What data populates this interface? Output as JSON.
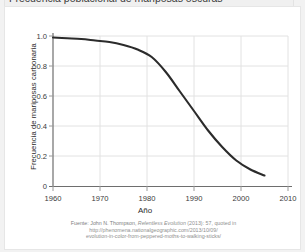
{
  "figure": {
    "title": "Frecuencia poblacional de mariposas oscuras"
  },
  "citation": {
    "line1_prefix": "Fuente: John N. Thompson, ",
    "line1_italic": "Relentless Evolution",
    "line1_suffix": " (2013): 57, quoted in",
    "line2": "http://phenomena.nationalgeographic.com/2013/10/09/",
    "line3": "evolution-in-color-from-peppered-moths-to-walking-sticks/"
  },
  "chart_data": {
    "type": "line",
    "title": "Frecuencia poblacional de mariposas oscuras",
    "xlabel": "Año",
    "ylabel": "Frecuencia de mariposas carbonaria",
    "xlim": [
      1958,
      2012
    ],
    "ylim": [
      0,
      1.0
    ],
    "grid": true,
    "legend": null,
    "line_color": "#2b2b2b",
    "grid_color": "#e0e0e0",
    "xticks": [
      "1960",
      "1970",
      "1980",
      "1990",
      "2000",
      "2010"
    ],
    "xtick_values": [
      1960,
      1970,
      1980,
      1990,
      2000,
      2010
    ],
    "yticks": [
      "0",
      "0.2",
      "0.4",
      "0.6",
      "0.8",
      "1.0"
    ],
    "ytick_values": [
      0,
      0.2,
      0.4,
      0.6,
      0.8,
      1.0
    ],
    "series": [
      {
        "name": "Frecuencia de mariposas carbonaria",
        "x": [
          1960,
          1963,
          1966,
          1969,
          1972,
          1975,
          1978,
          1981,
          1984,
          1987,
          1990,
          1993,
          1996,
          1999,
          2002,
          2005
        ],
        "values": [
          0.99,
          0.985,
          0.98,
          0.97,
          0.96,
          0.94,
          0.91,
          0.86,
          0.76,
          0.63,
          0.5,
          0.37,
          0.26,
          0.17,
          0.11,
          0.07
        ]
      }
    ]
  }
}
